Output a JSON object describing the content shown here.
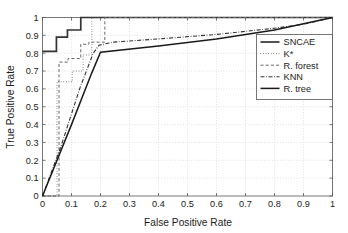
{
  "chart_data": {
    "type": "line",
    "title": "",
    "xlabel": "False Positive Rate",
    "ylabel": "True Positive Rate",
    "xlim": [
      0,
      1
    ],
    "ylim": [
      0,
      1
    ],
    "grid": true,
    "legend_position": "right",
    "xticks": [
      "0",
      "0.1",
      "0.2",
      "0.3",
      "0.4",
      "0.5",
      "0.6",
      "0.7",
      "0.8",
      "0.9",
      "1"
    ],
    "xtick_values": [
      0,
      0.1,
      0.2,
      0.3,
      0.4,
      0.5,
      0.6,
      0.7,
      0.8,
      0.9,
      1
    ],
    "yticks": [
      "0",
      "0.1",
      "0.2",
      "0.3",
      "0.4",
      "0.5",
      "0.6",
      "0.7",
      "0.8",
      "0.9",
      "1"
    ],
    "ytick_values": [
      0,
      0.1,
      0.2,
      0.3,
      0.4,
      0.5,
      0.6,
      0.7,
      0.8,
      0.9,
      1
    ],
    "series": [
      {
        "name": "SNCAE",
        "style": "solid",
        "color": "#333333",
        "width": 1.7,
        "points": [
          [
            0.0,
            0.81
          ],
          [
            0.048,
            0.81
          ],
          [
            0.048,
            0.89
          ],
          [
            0.086,
            0.89
          ],
          [
            0.086,
            0.93
          ],
          [
            0.132,
            0.93
          ],
          [
            0.132,
            1.0
          ],
          [
            1.0,
            1.0
          ]
        ]
      },
      {
        "name": "K*",
        "style": "dotted",
        "color": "#444444",
        "width": 1.0,
        "points": [
          [
            0.0,
            0.0
          ],
          [
            0.05,
            0.0
          ],
          [
            0.05,
            0.24
          ],
          [
            0.05,
            0.64
          ],
          [
            0.103,
            0.64
          ],
          [
            0.103,
            0.7
          ],
          [
            0.14,
            0.7
          ],
          [
            0.14,
            0.79
          ],
          [
            0.17,
            0.79
          ],
          [
            0.17,
            1.0
          ],
          [
            1.0,
            1.0
          ]
        ]
      },
      {
        "name": "R. forest",
        "style": "dashed",
        "color": "#666666",
        "width": 1.0,
        "points": [
          [
            0.0,
            0.0
          ],
          [
            0.057,
            0.0
          ],
          [
            0.057,
            0.75
          ],
          [
            0.088,
            0.75
          ],
          [
            0.088,
            0.77
          ],
          [
            0.132,
            0.77
          ],
          [
            0.132,
            0.85
          ],
          [
            0.16,
            0.85
          ],
          [
            0.16,
            0.862
          ],
          [
            0.215,
            0.862
          ],
          [
            0.215,
            1.0
          ],
          [
            1.0,
            1.0
          ]
        ]
      },
      {
        "name": "KNN",
        "style": "dashdot",
        "color": "#333333",
        "width": 1.1,
        "points": [
          [
            0.0,
            0.0
          ],
          [
            0.062,
            0.27
          ],
          [
            0.13,
            0.61
          ],
          [
            0.175,
            0.8
          ],
          [
            0.195,
            0.845
          ],
          [
            0.245,
            0.862
          ],
          [
            0.4,
            0.88
          ],
          [
            0.6,
            0.905
          ],
          [
            0.8,
            0.94
          ],
          [
            0.9,
            0.962
          ],
          [
            1.0,
            1.0
          ]
        ]
      },
      {
        "name": "R. tree",
        "style": "solid",
        "color": "#1a1a1a",
        "width": 1.5,
        "points": [
          [
            0.0,
            0.0
          ],
          [
            0.1,
            0.4
          ],
          [
            0.17,
            0.69
          ],
          [
            0.2,
            0.805
          ],
          [
            0.4,
            0.84
          ],
          [
            0.6,
            0.88
          ],
          [
            0.8,
            0.93
          ],
          [
            1.0,
            1.0
          ]
        ]
      }
    ]
  },
  "legend": {
    "entries": [
      {
        "label": "SNCAE"
      },
      {
        "label": "K*"
      },
      {
        "label": "R. forest"
      },
      {
        "label": "KNN"
      },
      {
        "label": "R. tree"
      }
    ]
  },
  "colors": {
    "background": "#ffffff",
    "axis": "#555555",
    "grid": "#c9c9c9",
    "text": "#1a1a1a"
  }
}
